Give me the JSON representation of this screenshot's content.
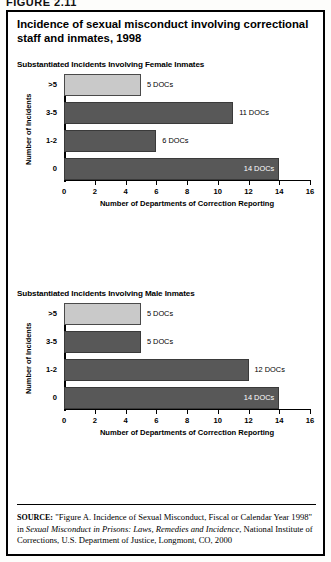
{
  "page_header": "FIGURE 2.11",
  "figure": {
    "title": "Incidence of sexual misconduct involving correctional staff and inmates, 1998"
  },
  "source_note": {
    "key": "SOURCE:",
    "text_before_italic": " \"Figure A. Incidence of Sexual Misconduct, Fiscal or Calendar Year 1998\" in ",
    "italic_title": "Sexual Misconduct in Prisons: Laws, Remedies and Incidence",
    "text_after_italic": ", National Institute of Corrections, U.S. Department of Justice, Longmont, CO, 2000"
  },
  "chart_data": [
    {
      "type": "bar",
      "orientation": "horizontal",
      "title": "Substantiated Incidents Involving Female Inmates",
      "categories": [
        ">5",
        "3-5",
        "1-2",
        "0"
      ],
      "values": [
        5,
        11,
        6,
        14
      ],
      "value_labels": [
        "5 DOCs",
        "11 DOCs",
        "6 DOCs",
        "14 DOCs"
      ],
      "label_inside": [
        false,
        false,
        false,
        true
      ],
      "bar_style": [
        "light",
        "dark",
        "dark",
        "dark"
      ],
      "xlabel": "Number of Departments of Correction Reporting",
      "ylabel": "Number of Incidents",
      "xlim": [
        0,
        16
      ],
      "xticks": [
        0,
        2,
        4,
        6,
        8,
        10,
        12,
        14,
        16
      ],
      "grid": false,
      "legend": "none"
    },
    {
      "type": "bar",
      "orientation": "horizontal",
      "title": "Substantiated Incidents Involving Male Inmates",
      "categories": [
        ">5",
        "3-5",
        "1-2",
        "0"
      ],
      "values": [
        5,
        5,
        12,
        14
      ],
      "value_labels": [
        "5 DOCs",
        "5 DOCs",
        "12 DOCs",
        "14 DOCs"
      ],
      "label_inside": [
        false,
        false,
        false,
        true
      ],
      "bar_style": [
        "light",
        "dark",
        "dark",
        "dark"
      ],
      "xlabel": "Number of Departments of Correction Reporting",
      "ylabel": "Number of Incidents",
      "xlim": [
        0,
        16
      ],
      "xticks": [
        0,
        2,
        4,
        6,
        8,
        10,
        12,
        14,
        16
      ],
      "grid": false,
      "legend": "none"
    }
  ],
  "colors": {
    "bar_light": "#c9c9c9",
    "bar_dark": "#585858",
    "border": "#000000",
    "label_inside": "#ffffff"
  }
}
